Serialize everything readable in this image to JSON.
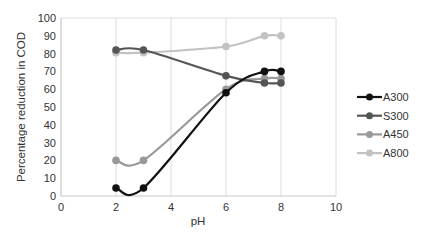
{
  "chart_data": {
    "type": "line",
    "title": "",
    "xlabel": "pH",
    "ylabel": "Percentage reduction in COD",
    "xlim": [
      0,
      10
    ],
    "ylim": [
      0,
      100
    ],
    "x_ticks": [
      0,
      2,
      4,
      6,
      8,
      10
    ],
    "y_ticks": [
      0,
      10,
      20,
      30,
      40,
      50,
      60,
      70,
      80,
      90,
      100
    ],
    "grid": {
      "vertical": true,
      "horizontal": false
    },
    "legend_position": "right",
    "series": [
      {
        "name": "A300",
        "color": "#111111",
        "x": [
          2,
          3,
          6,
          7.4,
          8
        ],
        "values": [
          4.5,
          4.5,
          58,
          70,
          70
        ]
      },
      {
        "name": "S300",
        "color": "#555555",
        "x": [
          2,
          3,
          6,
          7.4,
          8
        ],
        "values": [
          82,
          82,
          67.5,
          63.5,
          63.5
        ]
      },
      {
        "name": "A450",
        "color": "#999999",
        "x": [
          2,
          3,
          6,
          7.4,
          8
        ],
        "values": [
          20,
          20,
          60,
          66,
          66
        ]
      },
      {
        "name": "A800",
        "color": "#c2c2c2",
        "x": [
          2,
          3,
          6,
          7.4,
          8
        ],
        "values": [
          80.5,
          80.5,
          84,
          90,
          90
        ]
      }
    ]
  }
}
